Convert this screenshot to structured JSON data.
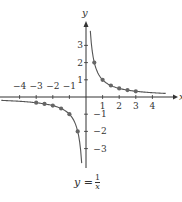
{
  "chart_data": {
    "type": "line",
    "title": "",
    "caption": "y = 1/x",
    "function": "y = 1/x",
    "xlabel": "x",
    "ylabel": "y",
    "xlim": [
      -5.2,
      5
    ],
    "ylim": [
      -4.3,
      4.3
    ],
    "x_ticks": [
      -4,
      -3,
      -2,
      -1,
      1,
      2,
      3,
      4
    ],
    "y_ticks": [
      -3,
      -2,
      -1,
      1,
      2,
      3
    ],
    "x_tick_labels": [
      "−4",
      "−3",
      "−2",
      "−1",
      "1",
      "2",
      "3",
      "4"
    ],
    "y_tick_labels": [
      "−3",
      "−2",
      "−1",
      "1",
      "2",
      "3"
    ],
    "grid": false,
    "series": [
      {
        "name": "positive branch",
        "points": [
          [
            0.5,
            2
          ],
          [
            1,
            1
          ],
          [
            1.5,
            0.67
          ],
          [
            2,
            0.5
          ],
          [
            2.5,
            0.4
          ],
          [
            3,
            0.33
          ]
        ]
      },
      {
        "name": "negative branch",
        "points": [
          [
            -0.5,
            -2
          ],
          [
            -1,
            -1
          ],
          [
            -1.5,
            -0.67
          ],
          [
            -2,
            -0.5
          ],
          [
            -2.5,
            -0.4
          ],
          [
            -3,
            -0.33
          ]
        ]
      }
    ],
    "colors": {
      "curve": "#555555",
      "axes": "#333333",
      "points": "#666666"
    }
  },
  "labels": {
    "x_axis": "x",
    "y_axis": "y",
    "caption_lhs": "y =",
    "caption_num": "1",
    "caption_den": "x"
  }
}
